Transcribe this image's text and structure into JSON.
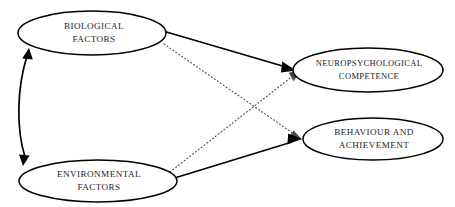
{
  "diagram": {
    "type": "conceptual-path-diagram",
    "background_color": "#ffffff",
    "line_color": "#000000",
    "dotted_line_color": "#4a4a4a",
    "text_color": "#1a1a1a",
    "nodes": [
      {
        "id": "biological-factors",
        "label_line1": "BIOLOGICAL",
        "label_line2": "FACTORS",
        "shape": "ellipse",
        "cx": 92,
        "cy": 33,
        "rx": 74,
        "ry": 22
      },
      {
        "id": "environmental-factors",
        "label_line1": "ENVIRONMENTAL",
        "label_line2": "FACTORS",
        "shape": "ellipse",
        "cx": 98,
        "cy": 181,
        "rx": 79,
        "ry": 21
      },
      {
        "id": "neuropsychological-competence",
        "label_line1": "NEUROPSYCHOLOGICAL",
        "label_line2": "COMPETENCE",
        "shape": "ellipse",
        "cx": 368,
        "cy": 70,
        "rx": 75,
        "ry": 22
      },
      {
        "id": "behaviour-and-achievement",
        "label_line1": "BEHAVIOUR AND",
        "label_line2": "ACHIEVEMENT",
        "shape": "ellipse",
        "cx": 373,
        "cy": 139,
        "rx": 70,
        "ry": 21
      }
    ],
    "edges": [
      {
        "id": "biological-to-neuropsychological",
        "from": "biological-factors",
        "to": "neuropsychological-competence",
        "style": "solid",
        "arrow": "single"
      },
      {
        "id": "environmental-to-behaviour",
        "from": "environmental-factors",
        "to": "behaviour-and-achievement",
        "style": "solid",
        "arrow": "single"
      },
      {
        "id": "biological-to-behaviour",
        "from": "biological-factors",
        "to": "behaviour-and-achievement",
        "style": "dotted",
        "arrow": "single"
      },
      {
        "id": "environmental-to-neuropsychological",
        "from": "environmental-factors",
        "to": "neuropsychological-competence",
        "style": "dotted",
        "arrow": "single"
      },
      {
        "id": "biological-environmental-reciprocal",
        "from": "biological-factors",
        "to": "environmental-factors",
        "style": "curved-solid",
        "arrow": "double"
      }
    ]
  }
}
